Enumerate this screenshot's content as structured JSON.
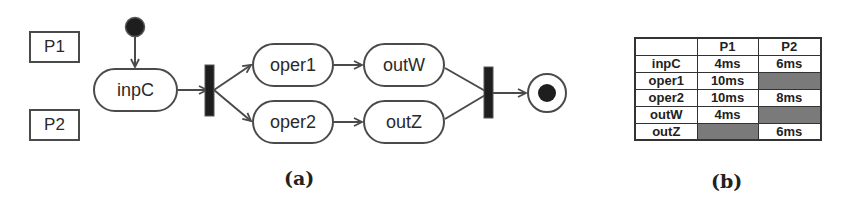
{
  "figure_a": {
    "caption": "(a)",
    "processors": [
      {
        "id": "P1",
        "label": "P1"
      },
      {
        "id": "P2",
        "label": "P2"
      }
    ],
    "nodes": {
      "start": {
        "type": "initial"
      },
      "inpC": {
        "label": "inpC"
      },
      "fork": {
        "type": "fork"
      },
      "oper1": {
        "label": "oper1"
      },
      "oper2": {
        "label": "oper2"
      },
      "outW": {
        "label": "outW"
      },
      "outZ": {
        "label": "outZ"
      },
      "join": {
        "type": "join"
      },
      "end": {
        "type": "final"
      }
    },
    "edges": [
      [
        "start",
        "inpC"
      ],
      [
        "inpC",
        "fork"
      ],
      [
        "fork",
        "oper1"
      ],
      [
        "fork",
        "oper2"
      ],
      [
        "oper1",
        "outW"
      ],
      [
        "oper2",
        "outZ"
      ],
      [
        "outW",
        "join"
      ],
      [
        "outZ",
        "join"
      ],
      [
        "join",
        "end"
      ]
    ]
  },
  "figure_b": {
    "caption": "(b)",
    "table": {
      "headers": [
        "",
        "P1",
        "P2"
      ],
      "rows": [
        {
          "task": "inpC",
          "P1": "4ms",
          "P2": "6ms"
        },
        {
          "task": "oper1",
          "P1": "10ms",
          "P2": null
        },
        {
          "task": "oper2",
          "P1": "10ms",
          "P2": "8ms"
        },
        {
          "task": "outW",
          "P1": "4ms",
          "P2": null
        },
        {
          "task": "outZ",
          "P1": null,
          "P2": "6ms"
        }
      ],
      "unavailable_cell_color": "#7a7a7a"
    }
  }
}
